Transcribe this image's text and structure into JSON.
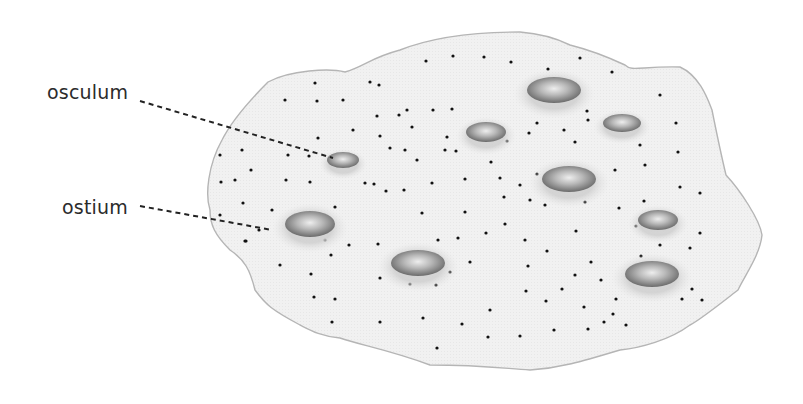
{
  "diagram": {
    "colors": {
      "body_fill": "#f1f1f1",
      "body_stroke": "#b5b5b5",
      "dot": "#111111",
      "leader": "#222222",
      "label": "#2b2b2b",
      "pore_dark": "#6e6e6e",
      "pore_light": "#e6e6e6",
      "pore_halo": "#d2d2d2"
    },
    "labels": [
      {
        "id": "osculum",
        "text": "osculum",
        "x": 47,
        "y": 83,
        "line": {
          "x1": 140,
          "y1": 101,
          "x2": 333,
          "y2": 158
        }
      },
      {
        "id": "ostium",
        "text": "ostium",
        "x": 62,
        "y": 198,
        "line": {
          "x1": 140,
          "y1": 206,
          "x2": 272,
          "y2": 230
        }
      }
    ],
    "body_outline": "M 268 82 C 290 70 330 68 345 72 C 365 66 370 58 400 50 C 430 38 470 32 520 32 C 545 34 560 40 570 45 C 590 50 610 58 625 65 C 632 72 640 66 680 67 C 700 76 708 100 712 110 C 716 130 720 150 726 175 C 740 190 760 220 762 235 C 760 255 745 275 738 290 C 725 300 700 320 690 325 C 670 340 640 348 620 350 C 580 362 560 368 530 370 C 500 368 480 365 430 365 C 390 350 360 345 340 338 C 320 336 310 330 300 325 C 272 310 266 305 255 290 C 250 270 245 260 230 250 C 215 235 210 225 210 210 C 205 195 208 165 222 140 C 232 120 250 100 268 82 Z",
    "pores": [
      {
        "cx": 554,
        "cy": 90,
        "rx": 27,
        "ry": 13
      },
      {
        "cx": 486,
        "cy": 132,
        "rx": 20,
        "ry": 10
      },
      {
        "cx": 622,
        "cy": 123,
        "rx": 19,
        "ry": 9
      },
      {
        "cx": 343,
        "cy": 160,
        "rx": 16,
        "ry": 8
      },
      {
        "cx": 569,
        "cy": 179,
        "rx": 27,
        "ry": 13
      },
      {
        "cx": 658,
        "cy": 220,
        "rx": 20,
        "ry": 10
      },
      {
        "cx": 310,
        "cy": 224,
        "rx": 25,
        "ry": 13
      },
      {
        "cx": 418,
        "cy": 263,
        "rx": 27,
        "ry": 13
      },
      {
        "cx": 652,
        "cy": 274,
        "rx": 27,
        "ry": 13
      }
    ],
    "dots": [
      [
        426,
        61
      ],
      [
        453,
        56
      ],
      [
        484,
        57
      ],
      [
        511,
        62
      ],
      [
        548,
        69
      ],
      [
        580,
        58
      ],
      [
        612,
        72
      ],
      [
        660,
        95
      ],
      [
        676,
        123
      ],
      [
        315,
        83
      ],
      [
        370,
        82
      ],
      [
        379,
        85
      ],
      [
        285,
        100
      ],
      [
        317,
        101
      ],
      [
        343,
        100
      ],
      [
        377,
        116
      ],
      [
        407,
        110
      ],
      [
        433,
        110
      ],
      [
        452,
        109
      ],
      [
        412,
        127
      ],
      [
        353,
        130
      ],
      [
        380,
        136
      ],
      [
        447,
        137
      ],
      [
        475,
        129
      ],
      [
        501,
        131
      ],
      [
        529,
        133
      ],
      [
        537,
        123
      ],
      [
        564,
        130
      ],
      [
        587,
        111
      ],
      [
        588,
        120
      ],
      [
        399,
        115
      ],
      [
        405,
        150
      ],
      [
        445,
        150
      ],
      [
        456,
        151
      ],
      [
        507,
        141
      ],
      [
        575,
        142
      ],
      [
        640,
        145
      ],
      [
        678,
        152
      ],
      [
        220,
        155
      ],
      [
        242,
        150
      ],
      [
        288,
        155
      ],
      [
        309,
        156
      ],
      [
        318,
        138
      ],
      [
        355,
        163
      ],
      [
        365,
        183
      ],
      [
        390,
        148
      ],
      [
        417,
        160
      ],
      [
        491,
        162
      ],
      [
        235,
        180
      ],
      [
        251,
        170
      ],
      [
        221,
        182
      ],
      [
        286,
        180
      ],
      [
        310,
        182
      ],
      [
        374,
        184
      ],
      [
        404,
        190
      ],
      [
        432,
        183
      ],
      [
        465,
        179
      ],
      [
        500,
        178
      ],
      [
        520,
        185
      ],
      [
        537,
        174
      ],
      [
        615,
        170
      ],
      [
        645,
        165
      ],
      [
        680,
        187
      ],
      [
        700,
        193
      ],
      [
        243,
        203
      ],
      [
        272,
        210
      ],
      [
        335,
        207
      ],
      [
        386,
        191
      ],
      [
        422,
        213
      ],
      [
        465,
        212
      ],
      [
        504,
        197
      ],
      [
        530,
        200
      ],
      [
        545,
        205
      ],
      [
        585,
        202
      ],
      [
        619,
        208
      ],
      [
        644,
        201
      ],
      [
        700,
        233
      ],
      [
        220,
        215
      ],
      [
        246,
        241
      ],
      [
        259,
        230
      ],
      [
        325,
        240
      ],
      [
        349,
        245
      ],
      [
        378,
        244
      ],
      [
        438,
        240
      ],
      [
        458,
        238
      ],
      [
        486,
        233
      ],
      [
        505,
        224
      ],
      [
        525,
        240
      ],
      [
        576,
        231
      ],
      [
        636,
        226
      ],
      [
        660,
        245
      ],
      [
        690,
        248
      ],
      [
        245,
        241
      ],
      [
        280,
        265
      ],
      [
        311,
        274
      ],
      [
        331,
        255
      ],
      [
        380,
        278
      ],
      [
        410,
        284
      ],
      [
        436,
        285
      ],
      [
        450,
        272
      ],
      [
        470,
        262
      ],
      [
        528,
        266
      ],
      [
        547,
        251
      ],
      [
        591,
        262
      ],
      [
        601,
        280
      ],
      [
        641,
        256
      ],
      [
        692,
        289
      ],
      [
        314,
        297
      ],
      [
        335,
        299
      ],
      [
        380,
        322
      ],
      [
        437,
        348
      ],
      [
        462,
        324
      ],
      [
        490,
        310
      ],
      [
        526,
        291
      ],
      [
        546,
        301
      ],
      [
        562,
        289
      ],
      [
        575,
        275
      ],
      [
        584,
        307
      ],
      [
        604,
        322
      ],
      [
        616,
        299
      ],
      [
        626,
        325
      ],
      [
        682,
        299
      ],
      [
        702,
        300
      ],
      [
        332,
        322
      ],
      [
        423,
        318
      ],
      [
        488,
        337
      ],
      [
        520,
        336
      ],
      [
        554,
        330
      ],
      [
        588,
        329
      ],
      [
        613,
        314
      ]
    ]
  }
}
